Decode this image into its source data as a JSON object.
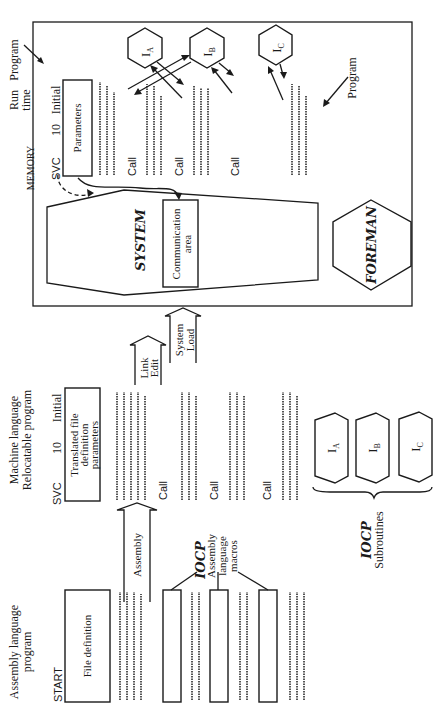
{
  "diagram": {
    "orientation": "rotated-90-ccw",
    "columns": {
      "assembly": {
        "title_line1": "Assembly language",
        "title_line2": "program",
        "start_label": "START",
        "file_definition": "File definition"
      },
      "macros": {
        "brand": "IOCP",
        "label_line1": "Assembly",
        "label_line2": "language",
        "label_line3": "macros"
      },
      "assembly_arrow": "Assembly",
      "machine": {
        "title_line1": "Machine language",
        "title_line2": "Relocatable program",
        "svc": "SVC",
        "svc_num": "10",
        "initial": "Initial",
        "box_line1": "Translated file",
        "box_line2": "definition",
        "box_line3": "parameters",
        "calls": [
          "Call",
          "Call",
          "Call"
        ]
      },
      "subroutines": {
        "brand": "IOCP",
        "label": "Subroutines",
        "items": [
          "I_A",
          "I_B",
          "I_C"
        ],
        "item_main": [
          "I",
          "I",
          "I"
        ],
        "item_sub": [
          "A",
          "B",
          "C"
        ]
      },
      "link_edit": {
        "line1": "Link",
        "line2": "Edit"
      },
      "system_load": {
        "line1": "System",
        "line2": "Load"
      },
      "runtime": {
        "title_line1": "Run",
        "title_line2": "time",
        "program_label": "Program",
        "memory_label": "MEMORY",
        "svc": "SVC",
        "svc_num": "10",
        "initial": "Initial",
        "parameters": "Parameters",
        "calls": [
          "Call",
          "Call",
          "Call"
        ],
        "program_label_inner": "Program",
        "hexagons": [
          "I_A",
          "I_B",
          "I_C"
        ],
        "hex_sub": [
          "A",
          "B",
          "C"
        ],
        "system_brand": "SYSTEM",
        "communication_line1": "Communication",
        "communication_line2": "area",
        "foreman_brand": "FOREMAN"
      }
    }
  },
  "colors": {
    "ink": "#1a1a1a",
    "background": "#ffffff"
  }
}
